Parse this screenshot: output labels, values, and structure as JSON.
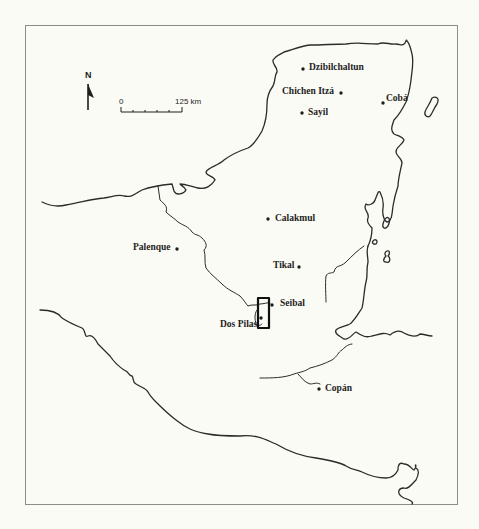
{
  "map": {
    "north_arrow": {
      "label": "N"
    },
    "scale_bar": {
      "start_label": "0",
      "end_label": "125 km"
    },
    "sites": [
      {
        "name": "Dzibilchaltun",
        "x": 303,
        "y": 69
      },
      {
        "name": "Chichen Itzá",
        "x": 341,
        "y": 93
      },
      {
        "name": "Cobá",
        "x": 383,
        "y": 103
      },
      {
        "name": "Sayil",
        "x": 302,
        "y": 113
      },
      {
        "name": "Calakmul",
        "x": 268,
        "y": 219
      },
      {
        "name": "Palenque",
        "x": 177,
        "y": 249
      },
      {
        "name": "Tikal",
        "x": 299,
        "y": 267
      },
      {
        "name": "Seibal",
        "x": 272,
        "y": 305
      },
      {
        "name": "Dos Pilas",
        "x": 261,
        "y": 318
      },
      {
        "name": "Copán",
        "x": 319,
        "y": 389
      }
    ],
    "highlight_box": {
      "label": "study-area"
    },
    "colors": {
      "line": "#2b2b2b",
      "frame": "#8d8d88",
      "background": "#fbfbf5"
    }
  }
}
